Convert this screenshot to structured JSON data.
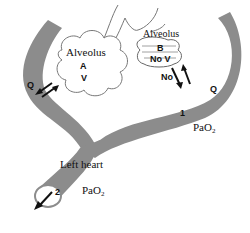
{
  "diagram": {
    "type": "physiology-schematic",
    "colors": {
      "vessel": "#8c8c8c",
      "alveolus_outline": "#666666",
      "arrow": "#111111",
      "background": "#ffffff"
    },
    "alveolus_a": {
      "title": "Alveolus",
      "letter": "A",
      "ventilation": "V"
    },
    "alveolus_b": {
      "title": "Alveolus",
      "letter": "B",
      "ventilation": "No V"
    },
    "vessel_labels": {
      "left_flow": "Q",
      "right_flow": "Q",
      "no_exchange": "No",
      "point_1": "1",
      "point_2": "2"
    },
    "pao2_right": {
      "base": "PaO",
      "sub": "2"
    },
    "pao2_bottom": {
      "base": "PaO",
      "sub": "2"
    },
    "left_heart": "Left heart"
  }
}
